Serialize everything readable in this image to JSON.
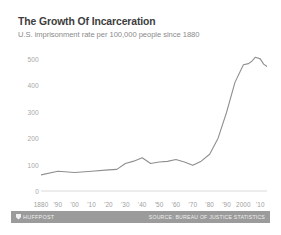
{
  "header": {
    "title": "The Growth Of Incarceration",
    "subtitle": "U.S. imprisonment rate per 100,000 people since 1880"
  },
  "footer": {
    "brand": "HUFFPOST",
    "brand_mark_icon": "shield-icon",
    "source": "SOURCE: BUREAU OF JUSTICE STATISTICS"
  },
  "colors": {
    "title": "#3d3d3d",
    "subtitle": "#8a8a8a",
    "line": "#8f8f8f",
    "axis": "#d6d6d6",
    "tick_label": "#a8a8a8",
    "footer_bar": "#9b9b9b",
    "footer_text": "#f0f0f0",
    "card_background": "#ffffff"
  },
  "chart_data": {
    "type": "line",
    "title": "The Growth Of Incarceration",
    "subtitle": "U.S. imprisonment rate per 100,000 people since 1880",
    "xlabel": "",
    "ylabel": "",
    "xlim": [
      1880,
      2014
    ],
    "ylim": [
      0,
      560
    ],
    "grid": false,
    "legend": "none",
    "ytick_values": [
      0,
      100,
      200,
      300,
      400,
      500
    ],
    "ytick_labels": [
      "0",
      "100",
      "200",
      "300",
      "400",
      "500"
    ],
    "xtick_values": [
      1880,
      1890,
      1900,
      1910,
      1920,
      1930,
      1940,
      1950,
      1960,
      1970,
      1980,
      1990,
      2000,
      2010
    ],
    "xtick_labels": [
      "1880",
      "'90",
      "'00",
      "'10",
      "'20",
      "'30",
      "'40",
      "'50",
      "'60",
      "'70",
      "'80",
      "'90",
      "2000",
      "'10"
    ],
    "series": [
      {
        "name": "U.S. imprisonment rate per 100,000",
        "x": [
          1880,
          1890,
          1900,
          1910,
          1920,
          1925,
          1930,
          1935,
          1940,
          1945,
          1950,
          1955,
          1960,
          1965,
          1970,
          1975,
          1980,
          1985,
          1990,
          1995,
          2000,
          2003,
          2005,
          2007,
          2008,
          2010,
          2012,
          2014
        ],
        "values": [
          61,
          75,
          70,
          75,
          80,
          82,
          104,
          113,
          126,
          104,
          110,
          112,
          119,
          110,
          97,
          113,
          139,
          200,
          297,
          411,
          478,
          482,
          491,
          506,
          504,
          500,
          480,
          471
        ]
      }
    ]
  }
}
